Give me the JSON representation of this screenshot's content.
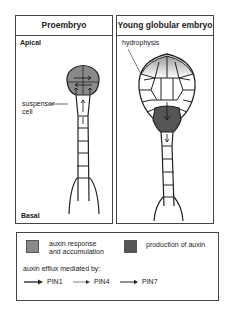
{
  "panels": [
    {
      "title": "Proembryo",
      "labels": {
        "top": "Apical",
        "bottom": "Basal",
        "annotation": "suspensor\ncell",
        "annotation_line1": "suspensor",
        "annotation_line2": "cell"
      }
    },
    {
      "title": "Young globular embryo",
      "labels": {
        "annotation": "hydrophysis"
      }
    }
  ],
  "legend": {
    "items": [
      {
        "label_line1": "auxin response",
        "label_line2": "and accumulation",
        "color": "#8a8a8a"
      },
      {
        "label_line1": "production of auxin",
        "color": "#555555"
      }
    ],
    "efflux_title": "auxin efflux mediated by:",
    "efflux_arrows": [
      {
        "label": "PIN1",
        "weight": "thick"
      },
      {
        "label": "PIN4",
        "weight": "thin"
      },
      {
        "label": "PIN7",
        "weight": "medium"
      }
    ]
  },
  "colors": {
    "auxin_response": "#8a8a8a",
    "auxin_production": "#555555",
    "outline": "#222222"
  }
}
